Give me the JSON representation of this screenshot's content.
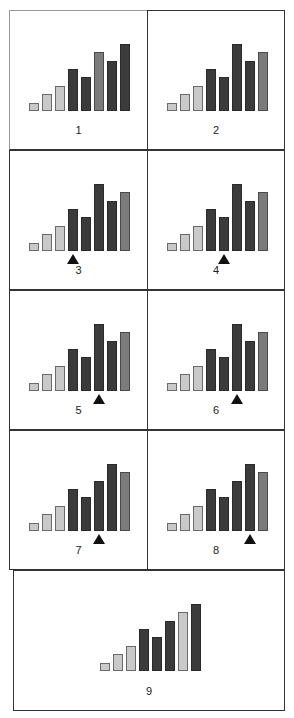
{
  "diagram": {
    "colors": {
      "light": "#c9c9c9",
      "dark": "#3b3b3b",
      "medium": "#7b7b7b",
      "border": "#333333",
      "marker": "#111111"
    },
    "panels": [
      {
        "label": "1",
        "heights": [
          10,
          20,
          30,
          50,
          40,
          70,
          60,
          80
        ],
        "shades": [
          "light",
          "light",
          "light",
          "dark",
          "dark",
          "medium",
          "dark",
          "dark"
        ],
        "marker": null
      },
      {
        "label": "2",
        "heights": [
          10,
          20,
          30,
          50,
          40,
          80,
          60,
          70
        ],
        "shades": [
          "light",
          "light",
          "light",
          "dark",
          "dark",
          "dark",
          "dark",
          "medium"
        ],
        "marker": null
      },
      {
        "label": "3",
        "heights": [
          10,
          20,
          30,
          50,
          40,
          80,
          60,
          70
        ],
        "shades": [
          "light",
          "light",
          "light",
          "dark",
          "dark",
          "dark",
          "dark",
          "medium"
        ],
        "marker": 3
      },
      {
        "label": "4",
        "heights": [
          10,
          20,
          30,
          50,
          40,
          80,
          60,
          70
        ],
        "shades": [
          "light",
          "light",
          "light",
          "dark",
          "dark",
          "dark",
          "dark",
          "medium"
        ],
        "marker": 4
      },
      {
        "label": "5",
        "heights": [
          10,
          20,
          30,
          50,
          40,
          80,
          60,
          70
        ],
        "shades": [
          "light",
          "light",
          "light",
          "dark",
          "dark",
          "dark",
          "dark",
          "medium"
        ],
        "marker": 5
      },
      {
        "label": "6",
        "heights": [
          10,
          20,
          30,
          50,
          40,
          80,
          60,
          70
        ],
        "shades": [
          "light",
          "light",
          "light",
          "dark",
          "dark",
          "dark",
          "dark",
          "medium"
        ],
        "marker": 5
      },
      {
        "label": "7",
        "heights": [
          10,
          20,
          30,
          50,
          40,
          60,
          80,
          70
        ],
        "shades": [
          "light",
          "light",
          "light",
          "dark",
          "dark",
          "dark",
          "dark",
          "medium"
        ],
        "marker": 5
      },
      {
        "label": "8",
        "heights": [
          10,
          20,
          30,
          50,
          40,
          60,
          80,
          70
        ],
        "shades": [
          "light",
          "light",
          "light",
          "dark",
          "dark",
          "dark",
          "dark",
          "medium"
        ],
        "marker": 6
      },
      {
        "label": "9",
        "heights": [
          10,
          20,
          30,
          50,
          40,
          60,
          70,
          80
        ],
        "shades": [
          "light",
          "light",
          "light",
          "dark",
          "dark",
          "dark",
          "light",
          "dark"
        ],
        "marker": null
      }
    ]
  }
}
